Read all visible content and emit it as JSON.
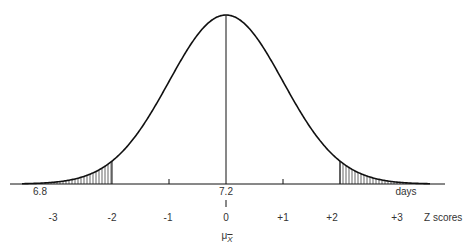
{
  "diagram": {
    "type": "normal-distribution-curve",
    "mean_label": "7.2",
    "left_value_label": "6.8",
    "unit_label": "days",
    "z_axis_label": "Z scores",
    "mu_symbol": "μ",
    "mu_subscript": "X",
    "z_ticks": [
      "-3",
      "-2",
      "-1",
      "0",
      "+1",
      "+2",
      "+3"
    ],
    "shaded_regions": [
      {
        "from_z": "-inf",
        "to_z": "-2",
        "side": "left"
      },
      {
        "from_z": "+2",
        "to_z": "+inf",
        "side": "right"
      }
    ],
    "colors": {
      "line": "#111111",
      "hatch": "#222222",
      "background": "#ffffff"
    }
  }
}
